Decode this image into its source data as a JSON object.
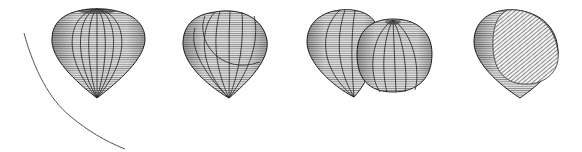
{
  "figure": {
    "panels": [
      {
        "id": "panel-1",
        "shape": "whole teardrop wireframe",
        "with_curve": true
      },
      {
        "id": "panel-2",
        "shape": "teardrop with rotated inner section"
      },
      {
        "id": "panel-3",
        "shape": "teardrop with separated lobe"
      },
      {
        "id": "panel-4",
        "shape": "teardrop with hatched cut face"
      }
    ],
    "colors": {
      "line": "#222222",
      "background": "#ffffff",
      "curve": "#555555"
    }
  }
}
